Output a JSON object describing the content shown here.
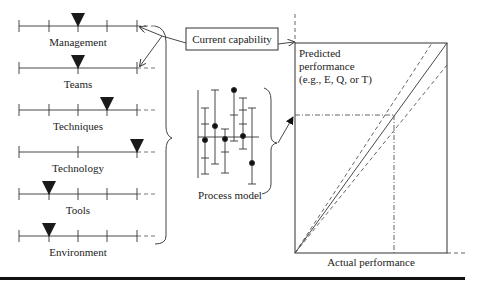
{
  "factors": [
    {
      "label": "Management",
      "y": 26,
      "ticks": [
        19,
        49,
        78,
        107,
        137
      ],
      "marker_x": 78
    },
    {
      "label": "Teams",
      "y": 68,
      "ticks": [
        19,
        78,
        137
      ],
      "marker_x": 78
    },
    {
      "label": "Techniques",
      "y": 110,
      "ticks": [
        19,
        49,
        78,
        107,
        137
      ],
      "marker_x": 107
    },
    {
      "label": "Technology",
      "y": 152,
      "ticks": [
        19,
        78,
        137
      ],
      "marker_x": 137
    },
    {
      "label": "Tools",
      "y": 194,
      "ticks": [
        19,
        49,
        78,
        107,
        137
      ],
      "marker_x": 49
    },
    {
      "label": "Environment",
      "y": 236,
      "ticks": [
        19,
        49,
        78,
        107,
        137
      ],
      "marker_x": 49
    }
  ],
  "current_capability": {
    "label": "Current capability"
  },
  "process_model": {
    "label": "Process model"
  },
  "prediction_chart": {
    "y_label_line1": "Predicted",
    "y_label_line2": "performance",
    "y_label_line3": "(e.g., E, Q, or T)",
    "x_label": "Actual performance"
  },
  "colors": {
    "line": "#333333",
    "marker": "#1a1a1a",
    "rule": "#111111"
  }
}
